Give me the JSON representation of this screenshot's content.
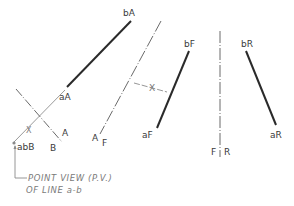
{
  "diagram": {
    "type": "descriptive-geometry-auxiliary-view",
    "views": {
      "auxiliary_A": {
        "endpoints": {
          "a": "aA",
          "b": "bA"
        }
      },
      "auxiliary_B": {
        "point_view": "abB"
      },
      "frontal_F": {
        "endpoints": {
          "a": "aF",
          "b": "bF"
        }
      },
      "profile_R": {
        "endpoints": {
          "a": "aR",
          "b": "bR"
        }
      }
    },
    "fold_lines": [
      {
        "left": "F",
        "right": "R"
      },
      {
        "left": "A",
        "right": "F"
      },
      {
        "left": "B",
        "right": "A"
      }
    ],
    "dimension_marker": "X",
    "annotation": {
      "line1": "POINT VIEW (P.V.)",
      "line2": "OF LINE a-b"
    },
    "colors": {
      "line": "#2a2a2a",
      "construction": "#8a8a8a",
      "text": "#3a3a3a"
    }
  }
}
